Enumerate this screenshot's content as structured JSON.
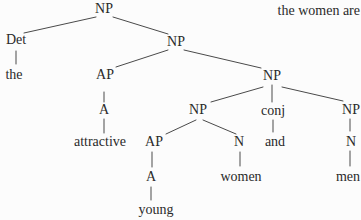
{
  "figure": {
    "context_text": "the women are",
    "colors": {
      "background": "#fcfcfc",
      "text": "#2a2a2a",
      "line": "#4a4a4a"
    }
  },
  "tree": {
    "nodes": [
      {
        "label": "NP",
        "type": "phrase"
      },
      {
        "label": "Det",
        "type": "category"
      },
      {
        "label": "the",
        "type": "word"
      },
      {
        "label": "NP",
        "type": "phrase"
      },
      {
        "label": "AP",
        "type": "phrase"
      },
      {
        "label": "A",
        "type": "category"
      },
      {
        "label": "attractive",
        "type": "word"
      },
      {
        "label": "NP",
        "type": "phrase"
      },
      {
        "label": "NP",
        "type": "phrase"
      },
      {
        "label": "AP",
        "type": "phrase"
      },
      {
        "label": "A",
        "type": "category"
      },
      {
        "label": "young",
        "type": "word"
      },
      {
        "label": "N",
        "type": "category"
      },
      {
        "label": "women",
        "type": "word"
      },
      {
        "label": "conj",
        "type": "category"
      },
      {
        "label": "and",
        "type": "word"
      },
      {
        "label": "NP",
        "type": "phrase"
      },
      {
        "label": "N",
        "type": "category"
      },
      {
        "label": "men",
        "type": "word"
      }
    ],
    "edges": [
      [
        0,
        1
      ],
      [
        0,
        3
      ],
      [
        1,
        2
      ],
      [
        3,
        4
      ],
      [
        3,
        7
      ],
      [
        4,
        5
      ],
      [
        5,
        6
      ],
      [
        7,
        8
      ],
      [
        7,
        14
      ],
      [
        7,
        16
      ],
      [
        8,
        9
      ],
      [
        8,
        12
      ],
      [
        9,
        10
      ],
      [
        10,
        11
      ],
      [
        12,
        13
      ],
      [
        14,
        15
      ],
      [
        16,
        17
      ],
      [
        17,
        18
      ]
    ]
  }
}
